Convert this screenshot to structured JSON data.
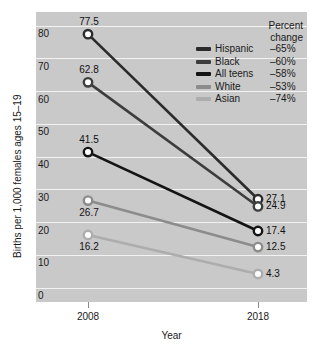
{
  "chart_data": {
    "type": "line",
    "title": "",
    "xlabel": "Year",
    "ylabel": "Births per 1,000 females ages 15–19",
    "categories": [
      "2008",
      "2018"
    ],
    "x": [
      2008,
      2018
    ],
    "ylim": [
      0,
      80
    ],
    "yticks": [
      0,
      10,
      20,
      30,
      40,
      50,
      60,
      70,
      80
    ],
    "ytick_labels": [
      "0",
      "10",
      "20",
      "30",
      "40",
      "50",
      "60",
      "70",
      "80"
    ],
    "grid": true,
    "legend_position": "upper right",
    "legend_header": [
      "Percent",
      "change"
    ],
    "plot_background": "#c9c9c9",
    "gridline_color": "#f2f2f2",
    "series": [
      {
        "name": "Hispanic",
        "values": [
          77.5,
          27.1
        ],
        "labels": [
          "77.5",
          "27.1"
        ],
        "percent_change": "–65%",
        "color": "#2b2b2b",
        "label_pos": [
          "above",
          "right"
        ]
      },
      {
        "name": "Black",
        "values": [
          62.8,
          24.9
        ],
        "labels": [
          "62.8",
          "24.9"
        ],
        "percent_change": "–60%",
        "color": "#3d3d3d",
        "label_pos": [
          "above",
          "right"
        ]
      },
      {
        "name": "All teens",
        "values": [
          41.5,
          17.4
        ],
        "labels": [
          "41.5",
          "17.4"
        ],
        "percent_change": "–58%",
        "color": "#141414",
        "label_pos": [
          "above",
          "right"
        ]
      },
      {
        "name": "White",
        "values": [
          26.7,
          12.5
        ],
        "labels": [
          "26.7",
          "12.5"
        ],
        "percent_change": "–53%",
        "color": "#8c8c8c",
        "label_pos": [
          "below",
          "right"
        ]
      },
      {
        "name": "Asian",
        "values": [
          16.2,
          4.3
        ],
        "labels": [
          "16.2",
          "4.3"
        ],
        "percent_change": "–74%",
        "color": "#adadad",
        "label_pos": [
          "below",
          "right"
        ]
      }
    ]
  }
}
